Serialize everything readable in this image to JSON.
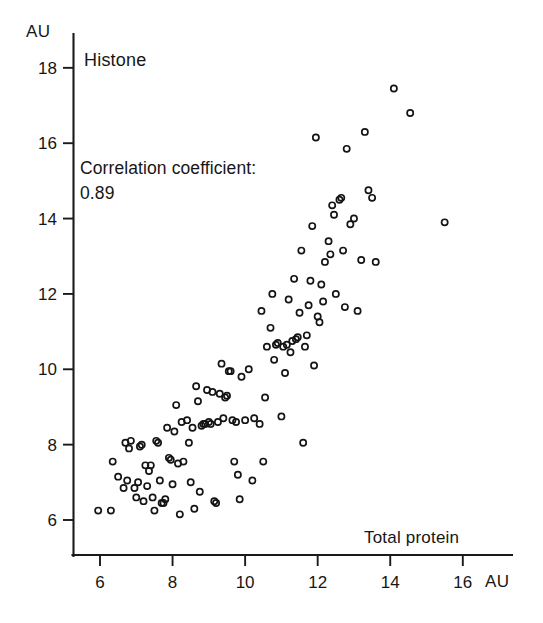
{
  "figure": {
    "series_label": "Histone",
    "annotation_line1": "Correlation coefficient:",
    "annotation_line2": "0.89",
    "xlabel": "Total protein",
    "y_unit": "AU",
    "x_unit": "AU"
  },
  "chart_data": {
    "type": "scatter",
    "title": "Histone",
    "xlabel": "Total protein",
    "ylabel": "AU",
    "x_unit": "AU",
    "y_unit": "AU",
    "xlim": [
      5.2,
      16.8
    ],
    "ylim": [
      5.4,
      18.6
    ],
    "xticks": [
      6,
      8,
      10,
      12,
      14,
      16
    ],
    "yticks": [
      6,
      8,
      10,
      12,
      14,
      16,
      18
    ],
    "grid": false,
    "legend": null,
    "annotations": [
      {
        "text": "Histone",
        "x": 5.6,
        "y": 17.9
      },
      {
        "text": "Correlation coefficient:",
        "x": 5.4,
        "y": 14.9
      },
      {
        "text": "0.89",
        "x": 5.4,
        "y": 14.3
      }
    ],
    "correlation_coefficient": 0.89,
    "n_points": 126,
    "marker": "open-circle",
    "points": [
      [
        5.95,
        6.25
      ],
      [
        6.3,
        6.25
      ],
      [
        6.35,
        7.55
      ],
      [
        6.5,
        7.15
      ],
      [
        6.65,
        6.85
      ],
      [
        6.7,
        8.05
      ],
      [
        6.75,
        7.05
      ],
      [
        6.8,
        7.9
      ],
      [
        6.85,
        8.1
      ],
      [
        6.95,
        6.85
      ],
      [
        7.0,
        6.6
      ],
      [
        7.05,
        7.0
      ],
      [
        7.1,
        7.95
      ],
      [
        7.15,
        8.0
      ],
      [
        7.2,
        6.5
      ],
      [
        7.25,
        7.45
      ],
      [
        7.3,
        6.9
      ],
      [
        7.35,
        7.3
      ],
      [
        7.4,
        7.45
      ],
      [
        7.45,
        6.6
      ],
      [
        7.5,
        6.25
      ],
      [
        7.55,
        8.1
      ],
      [
        7.6,
        8.05
      ],
      [
        7.65,
        7.05
      ],
      [
        7.7,
        6.45
      ],
      [
        7.75,
        6.45
      ],
      [
        7.8,
        6.55
      ],
      [
        7.85,
        8.45
      ],
      [
        7.9,
        7.65
      ],
      [
        7.95,
        7.6
      ],
      [
        8.0,
        6.95
      ],
      [
        8.05,
        8.35
      ],
      [
        8.1,
        9.05
      ],
      [
        8.15,
        7.5
      ],
      [
        8.2,
        6.15
      ],
      [
        8.25,
        8.6
      ],
      [
        8.3,
        7.55
      ],
      [
        8.4,
        8.65
      ],
      [
        8.45,
        8.05
      ],
      [
        8.5,
        7.0
      ],
      [
        8.55,
        8.45
      ],
      [
        8.6,
        6.3
      ],
      [
        8.65,
        9.55
      ],
      [
        8.7,
        9.15
      ],
      [
        8.75,
        6.75
      ],
      [
        8.8,
        8.5
      ],
      [
        8.85,
        8.55
      ],
      [
        8.9,
        8.55
      ],
      [
        8.95,
        9.45
      ],
      [
        9.0,
        8.6
      ],
      [
        9.05,
        8.55
      ],
      [
        9.1,
        9.4
      ],
      [
        9.15,
        6.5
      ],
      [
        9.2,
        6.45
      ],
      [
        9.25,
        8.6
      ],
      [
        9.3,
        9.35
      ],
      [
        9.35,
        10.15
      ],
      [
        9.4,
        8.7
      ],
      [
        9.45,
        9.25
      ],
      [
        9.5,
        9.3
      ],
      [
        9.55,
        9.95
      ],
      [
        9.6,
        9.95
      ],
      [
        9.65,
        8.65
      ],
      [
        9.7,
        7.55
      ],
      [
        9.75,
        8.6
      ],
      [
        9.8,
        7.2
      ],
      [
        9.85,
        6.55
      ],
      [
        9.9,
        9.8
      ],
      [
        10.0,
        8.65
      ],
      [
        10.1,
        10.0
      ],
      [
        10.2,
        7.05
      ],
      [
        10.25,
        8.7
      ],
      [
        10.4,
        8.55
      ],
      [
        10.45,
        11.55
      ],
      [
        10.5,
        7.55
      ],
      [
        10.55,
        9.25
      ],
      [
        10.6,
        10.6
      ],
      [
        10.7,
        11.1
      ],
      [
        10.75,
        12.0
      ],
      [
        10.8,
        10.25
      ],
      [
        10.85,
        10.65
      ],
      [
        10.9,
        10.7
      ],
      [
        11.0,
        8.75
      ],
      [
        11.05,
        10.6
      ],
      [
        11.1,
        9.9
      ],
      [
        11.15,
        10.65
      ],
      [
        11.2,
        11.85
      ],
      [
        11.25,
        10.45
      ],
      [
        11.3,
        10.75
      ],
      [
        11.35,
        12.4
      ],
      [
        11.4,
        10.8
      ],
      [
        11.45,
        10.85
      ],
      [
        11.5,
        11.5
      ],
      [
        11.55,
        13.15
      ],
      [
        11.6,
        8.05
      ],
      [
        11.65,
        10.6
      ],
      [
        11.7,
        10.9
      ],
      [
        11.75,
        11.7
      ],
      [
        11.8,
        12.35
      ],
      [
        11.85,
        13.8
      ],
      [
        11.9,
        10.1
      ],
      [
        11.95,
        16.15
      ],
      [
        12.0,
        11.4
      ],
      [
        12.05,
        11.25
      ],
      [
        12.1,
        12.25
      ],
      [
        12.15,
        11.8
      ],
      [
        12.2,
        12.85
      ],
      [
        12.3,
        13.4
      ],
      [
        12.35,
        13.05
      ],
      [
        12.4,
        14.35
      ],
      [
        12.45,
        14.1
      ],
      [
        12.5,
        12.0
      ],
      [
        12.6,
        14.5
      ],
      [
        12.65,
        14.55
      ],
      [
        12.7,
        13.15
      ],
      [
        12.75,
        11.65
      ],
      [
        12.8,
        15.85
      ],
      [
        12.9,
        13.85
      ],
      [
        13.0,
        14.0
      ],
      [
        13.1,
        11.55
      ],
      [
        13.2,
        12.9
      ],
      [
        13.3,
        16.3
      ],
      [
        13.4,
        14.75
      ],
      [
        13.5,
        14.55
      ],
      [
        13.6,
        12.85
      ],
      [
        14.1,
        17.45
      ],
      [
        14.55,
        16.8
      ],
      [
        15.5,
        13.9
      ]
    ]
  }
}
